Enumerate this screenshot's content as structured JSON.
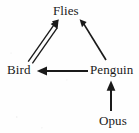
{
  "diagram": {
    "type": "directed-graph",
    "background_color": "#fefefe",
    "ink_color": "#1a1a1a",
    "nodes": [
      {
        "id": "flies",
        "label": "Flies",
        "x": 71,
        "y": 11
      },
      {
        "id": "bird",
        "label": "Bird",
        "x": 21,
        "y": 70
      },
      {
        "id": "penguin",
        "label": "Penguin",
        "x": 112,
        "y": 70
      },
      {
        "id": "opus",
        "label": "Opus",
        "x": 114,
        "y": 121
      }
    ],
    "edges": [
      {
        "id": "bird-flies",
        "from": "Bird",
        "to": "Flies",
        "style": "double-line",
        "arrowhead": "solid",
        "direction": "up-right",
        "x1": 30,
        "y1": 61,
        "x2": 58,
        "y2": 21
      },
      {
        "id": "penguin-flies",
        "from": "Penguin",
        "to": "Flies",
        "style": "single-line",
        "arrowhead": "solid",
        "direction": "up-left",
        "x1": 106,
        "y1": 60,
        "x2": 80,
        "y2": 21
      },
      {
        "id": "penguin-bird",
        "from": "Penguin",
        "to": "Bird",
        "style": "single-line",
        "arrowhead": "solid",
        "direction": "left",
        "x1": 88,
        "y1": 71,
        "x2": 37,
        "y2": 71
      },
      {
        "id": "opus-penguin",
        "from": "Opus",
        "to": "Penguin",
        "style": "single-line",
        "arrowhead": "solid",
        "direction": "up",
        "x1": 111,
        "y1": 111,
        "x2": 111,
        "y2": 81
      }
    ]
  }
}
